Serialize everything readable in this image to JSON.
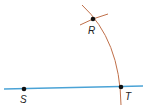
{
  "diagram": {
    "type": "geometric-construction",
    "colors": {
      "line": "#4aa3d6",
      "arc": "#c0704a",
      "point": "#111111",
      "label": "#222222",
      "background": "#ffffff"
    },
    "line": {
      "from": [
        4,
        89
      ],
      "to": [
        143,
        86
      ],
      "label": "line through S and T"
    },
    "arcs": [
      {
        "name": "main-arc",
        "from": [
          82,
          5
        ],
        "through": [
          93,
          19
        ],
        "to": [
          121,
          105
        ]
      },
      {
        "name": "crossing-arc",
        "from": [
          80,
          25
        ],
        "to": [
          108,
          14
        ]
      }
    ],
    "points": [
      {
        "name": "R",
        "x": 93,
        "y": 19,
        "label": "R",
        "label_x": 88,
        "label_y": 34
      },
      {
        "name": "S",
        "x": 24,
        "y": 89,
        "label": "S",
        "label_x": 20,
        "label_y": 103
      },
      {
        "name": "T",
        "x": 121,
        "y": 87,
        "label": "T",
        "label_x": 125,
        "label_y": 100
      }
    ]
  }
}
